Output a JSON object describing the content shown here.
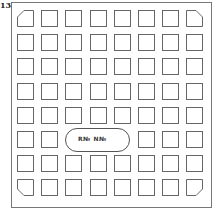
{
  "figure": {
    "label": "13",
    "grid_rows": 8,
    "grid_cols": 8,
    "pad_shape": "square",
    "chamfered_corners": [
      "top-left",
      "top-right",
      "bottom-left",
      "bottom-right"
    ],
    "pill": {
      "row": 6,
      "col_start": 3,
      "col_end": 5,
      "text": "R№ N№"
    }
  }
}
